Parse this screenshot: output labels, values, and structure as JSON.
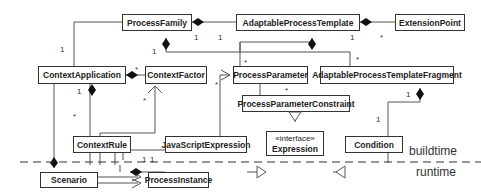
{
  "classes": {
    "process_family": "ProcessFamily",
    "adaptable_process_template": "AdaptableProcessTemplate",
    "extension_point": "ExtensionPoint",
    "context_application": "ContextApplication",
    "context_factor": "ContextFactor",
    "process_parameter": "ProcessParameter",
    "adaptable_process_template_fragment": "AdaptableProcessTemplateFragment",
    "process_parameter_constraint": "ProcessParameterConstraint",
    "context_rule": "ContextRule",
    "javascript_expression": "JavaScriptExpression",
    "expression_stereotype": "«interface»",
    "expression": "Expression",
    "condition": "Condition",
    "scenario": "Scenario",
    "process_instance": "ProcessInstance"
  },
  "layers": {
    "buildtime": "buildtime",
    "runtime": "runtime"
  },
  "multiplicities": {
    "one": "1",
    "many": "*"
  }
}
